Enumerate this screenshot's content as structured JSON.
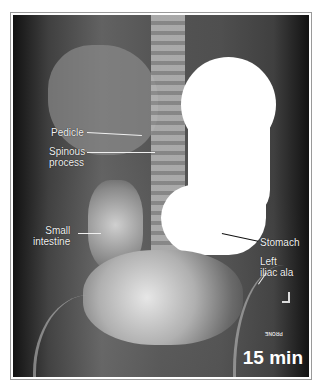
{
  "figure": {
    "time_label": "15 min",
    "marker_text": "PRONE",
    "labels": [
      {
        "id": "pedicle",
        "text": "Pedicle"
      },
      {
        "id": "spinous",
        "text": "Spinous\nprocess"
      },
      {
        "id": "small-intestine",
        "text": "Small\nintestine"
      },
      {
        "id": "stomach",
        "text": "Stomach"
      },
      {
        "id": "iliac",
        "text": "Left\niliac ala"
      }
    ],
    "side_marker": "L"
  }
}
